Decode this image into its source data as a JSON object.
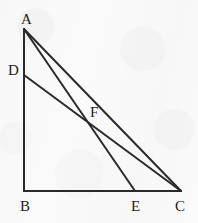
{
  "figure": {
    "kind": "euclidean-geometry-figure",
    "canvas": {
      "width": 198,
      "height": 223
    },
    "background_color": "#fafafa",
    "stroke_color": "#2a2a2a",
    "label_color": "#1d1d1d",
    "stroke_width": 2,
    "points": [
      {
        "id": "A",
        "label": "A",
        "x": 24,
        "y": 29,
        "label_x": 21,
        "label_y": 12,
        "on": "apex of triangle"
      },
      {
        "id": "D",
        "label": "D",
        "x": 24,
        "y": 75,
        "label_x": 8,
        "label_y": 63,
        "on": "segment AB"
      },
      {
        "id": "F",
        "label": "F",
        "x": 88,
        "y": 124,
        "label_x": 90,
        "label_y": 105,
        "on": "intersection of AE and DC"
      },
      {
        "id": "B",
        "label": "B",
        "x": 24,
        "y": 191,
        "label_x": 20,
        "label_y": 199,
        "on": "right-angle vertex"
      },
      {
        "id": "E",
        "label": "E",
        "x": 135,
        "y": 191,
        "label_x": 131,
        "label_y": 199,
        "on": "segment BC"
      },
      {
        "id": "C",
        "label": "C",
        "x": 181,
        "y": 191,
        "label_x": 175,
        "label_y": 199,
        "on": "base-right vertex"
      }
    ],
    "segments": [
      {
        "id": "AB",
        "name": "segment-ab",
        "from": "A",
        "to": "B",
        "x1": 24,
        "y1": 29,
        "x2": 24,
        "y2": 191
      },
      {
        "id": "BC",
        "name": "segment-bc",
        "from": "B",
        "to": "C",
        "x1": 24,
        "y1": 191,
        "x2": 181,
        "y2": 191
      },
      {
        "id": "AC",
        "name": "segment-ac",
        "from": "A",
        "to": "C",
        "x1": 24,
        "y1": 29,
        "x2": 181,
        "y2": 191
      },
      {
        "id": "AE",
        "name": "cevian-ae",
        "from": "A",
        "to": "E",
        "x1": 24,
        "y1": 29,
        "x2": 135,
        "y2": 191
      },
      {
        "id": "DC",
        "name": "cevian-dc",
        "from": "D",
        "to": "C",
        "x1": 24,
        "y1": 75,
        "x2": 181,
        "y2": 191
      }
    ]
  }
}
